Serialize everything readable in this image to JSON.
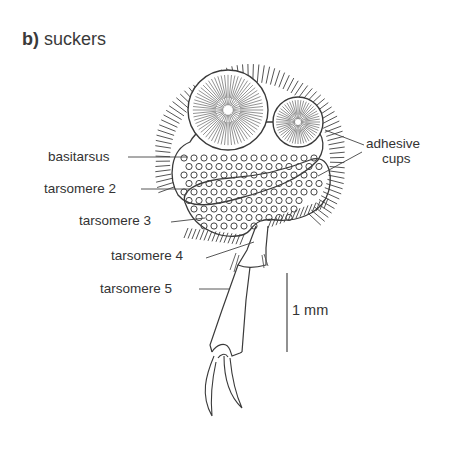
{
  "figure": {
    "panel_letter": "b)",
    "title": "suckers",
    "labels": {
      "adhesive_cups_line1": "adhesive",
      "adhesive_cups_line2": "cups",
      "basitarsus": "basitarsus",
      "tarsomere_2": "tarsomere 2",
      "tarsomere_3": "tarsomere 3",
      "tarsomere_4": "tarsomere 4",
      "tarsomere_5": "tarsomere 5"
    },
    "scale_bar": {
      "label": "1 mm"
    },
    "ink_color": "#3a3a3a",
    "background": "#ffffff"
  }
}
